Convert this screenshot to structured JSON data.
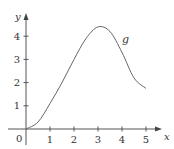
{
  "chart_data": {
    "type": "line",
    "title": "",
    "xlabel": "x",
    "ylabel": "y",
    "origin_label": "0",
    "x_ticks": [
      "1",
      "2",
      "3",
      "4",
      "5"
    ],
    "y_ticks": [
      "1",
      "2",
      "3",
      "4"
    ],
    "xlim": [
      0,
      5.5
    ],
    "ylim": [
      0,
      4.8
    ],
    "grid": false,
    "legend": "none",
    "series": [
      {
        "name": "g",
        "x": [
          0,
          0.5,
          1,
          1.5,
          2,
          2.5,
          3,
          3.5,
          4,
          4.5,
          5
        ],
        "values": [
          0,
          0.3,
          1.1,
          2.0,
          3.0,
          3.9,
          4.4,
          4.2,
          3.3,
          2.2,
          1.75
        ]
      }
    ],
    "annotations": [
      {
        "text": "g",
        "x": 4,
        "y": 3.7
      }
    ]
  }
}
